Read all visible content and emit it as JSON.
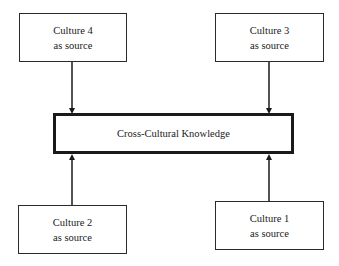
{
  "diagram": {
    "center": {
      "label": "Cross-Cultural Knowledge"
    },
    "sources": [
      {
        "id": "culture-4",
        "line1": "Culture 4",
        "line2": "as source",
        "position": "top-left"
      },
      {
        "id": "culture-3",
        "line1": "Culture 3",
        "line2": "as source",
        "position": "top-right"
      },
      {
        "id": "culture-2",
        "line1": "Culture 2",
        "line2": "as source",
        "position": "bottom-left"
      },
      {
        "id": "culture-1",
        "line1": "Culture 1",
        "line2": "as source",
        "position": "bottom-right"
      }
    ],
    "edges": [
      {
        "from": "Culture 4",
        "to": "Cross-Cultural Knowledge"
      },
      {
        "from": "Culture 3",
        "to": "Cross-Cultural Knowledge"
      },
      {
        "from": "Culture 2",
        "to": "Cross-Cultural Knowledge"
      },
      {
        "from": "Culture 1",
        "to": "Cross-Cultural Knowledge"
      }
    ],
    "colors": {
      "stroke": "#1a1a1a",
      "background": "#ffffff"
    }
  }
}
